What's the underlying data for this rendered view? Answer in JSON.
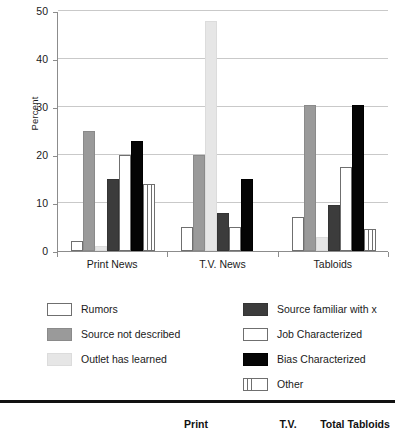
{
  "chart_data": {
    "type": "bar",
    "title": "",
    "subtitle": "",
    "xlabel": "",
    "ylabel": "Percent",
    "ylim": [
      0,
      50
    ],
    "yticks": [
      0,
      10,
      20,
      30,
      40,
      50
    ],
    "grid": true,
    "legend_position": "bottom",
    "categories": [
      "Print News",
      "T.V. News",
      "Tabloids"
    ],
    "series": [
      {
        "name": "Rumors",
        "fill": "white-outline",
        "color": "#ffffff",
        "values": [
          2,
          5,
          7
        ]
      },
      {
        "name": "Source not described",
        "fill": "medium-gray",
        "color": "#9a9a9a",
        "values": [
          25,
          20,
          30.5
        ]
      },
      {
        "name": "Outlet has learned",
        "fill": "very-light-gray",
        "color": "#e6e6e6",
        "values": [
          1,
          48,
          3
        ]
      },
      {
        "name": "Source familiar with x",
        "fill": "dark-gray",
        "color": "#3c3c3c",
        "values": [
          15,
          8,
          9.5
        ]
      },
      {
        "name": "Job Characterized",
        "fill": "white-outline",
        "color": "#ffffff",
        "values": [
          20,
          5,
          17.5
        ]
      },
      {
        "name": "Bias Characterized",
        "fill": "black",
        "color": "#050505",
        "values": [
          23,
          15,
          30.5
        ]
      },
      {
        "name": "Other",
        "fill": "vertical-stripes",
        "color": "#ffffff",
        "values": [
          14,
          0,
          4.5
        ]
      }
    ]
  },
  "axis": {
    "y_title": "Percent",
    "y_tick_labels": [
      "50",
      "40",
      "30",
      "20",
      "10",
      "0"
    ],
    "x_tick_labels": [
      "Print News",
      "T.V. News",
      "Tabloids"
    ]
  },
  "legend": {
    "left_column": [
      {
        "label": "Rumors",
        "swatch": "white-outline-swatch"
      },
      {
        "label": "Source not described",
        "swatch": "medium-gray-swatch"
      },
      {
        "label": "Outlet has learned",
        "swatch": "very-light-gray-swatch"
      }
    ],
    "right_column": [
      {
        "label": "Source familiar with x",
        "swatch": "dark-gray-swatch"
      },
      {
        "label": "Job Characterized",
        "swatch": "white-outline-swatch"
      },
      {
        "label": "Bias Characterized",
        "swatch": "black-swatch"
      },
      {
        "label": "Other",
        "swatch": "vertical-stripes-swatch"
      }
    ]
  },
  "table_header": {
    "col_print": "Print",
    "col_tv": "T.V.",
    "col_total_tabloids": "Total Tabloids"
  }
}
